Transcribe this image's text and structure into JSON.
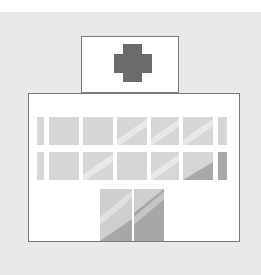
{
  "illustration": {
    "subject": "hospital-building",
    "colors": {
      "background": "#e9e9e9",
      "outline": "#7a7a7a",
      "cross": "#6b6b6b",
      "window": "#d6d6d6",
      "window_shadow": "#a9a9a9",
      "wall": "#ffffff"
    },
    "sign": {
      "icon": "medical-cross-icon"
    },
    "windows": {
      "rows": 2,
      "columns": 7
    },
    "doors": 2
  }
}
